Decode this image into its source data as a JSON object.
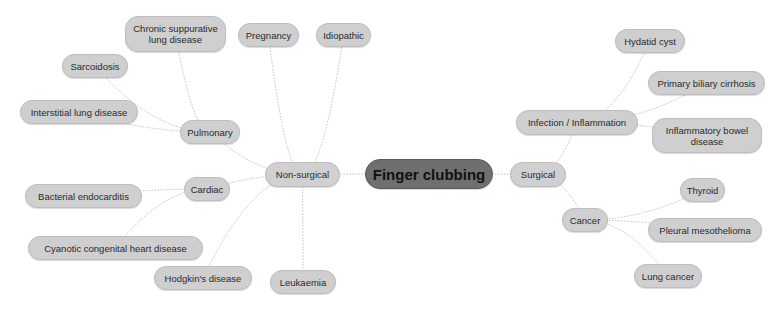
{
  "diagram": {
    "type": "mind-map",
    "colors": {
      "root_fill": "#6f6f6f",
      "node_fill": "#cfcfcf",
      "node_border": "#bdbdbd",
      "link": "#b8b8b8",
      "text": "#2a2a2a"
    },
    "nodes": [
      {
        "id": "root",
        "label": "Finger clubbing",
        "x": 365,
        "y": 159,
        "w": 128,
        "h": 30,
        "cls": "root"
      },
      {
        "id": "nonsurgical",
        "label": "Non-surgical",
        "x": 265,
        "y": 162,
        "w": 75,
        "h": 25,
        "cls": "l1"
      },
      {
        "id": "surgical",
        "label": "Surgical",
        "x": 510,
        "y": 162,
        "w": 56,
        "h": 25,
        "cls": "l1"
      },
      {
        "id": "pulmonary",
        "label": "Pulmonary",
        "x": 180,
        "y": 120,
        "w": 60,
        "h": 24,
        "cls": "l2"
      },
      {
        "id": "cardiac",
        "label": "Cardiac",
        "x": 184,
        "y": 177,
        "w": 46,
        "h": 24,
        "cls": "l2"
      },
      {
        "id": "chronic",
        "label": "Chronic suppurative lung disease",
        "x": 125,
        "y": 16,
        "w": 101,
        "h": 36,
        "cls": "l3"
      },
      {
        "id": "pregnancy",
        "label": "Pregnancy",
        "x": 238,
        "y": 23,
        "w": 61,
        "h": 24,
        "cls": "l3"
      },
      {
        "id": "idiopathic",
        "label": "Idiopathic",
        "x": 316,
        "y": 23,
        "w": 55,
        "h": 24,
        "cls": "l3"
      },
      {
        "id": "sarcoidosis",
        "label": "Sarcoidosis",
        "x": 62,
        "y": 54,
        "w": 66,
        "h": 24,
        "cls": "l3"
      },
      {
        "id": "interstitial",
        "label": "Interstitial lung disease",
        "x": 20,
        "y": 100,
        "w": 118,
        "h": 24,
        "cls": "l3"
      },
      {
        "id": "bacterial",
        "label": "Bacterial endocarditis",
        "x": 25,
        "y": 184,
        "w": 117,
        "h": 24,
        "cls": "l3"
      },
      {
        "id": "cyanotic",
        "label": "Cyanotic congenital heart disease",
        "x": 28,
        "y": 236,
        "w": 175,
        "h": 24,
        "cls": "l3"
      },
      {
        "id": "hodgkin",
        "label": "Hodgkin's disease",
        "x": 154,
        "y": 266,
        "w": 98,
        "h": 24,
        "cls": "l3"
      },
      {
        "id": "leukaemia",
        "label": "Leukaemia",
        "x": 270,
        "y": 270,
        "w": 66,
        "h": 24,
        "cls": "l3"
      },
      {
        "id": "infection",
        "label": "Infection / Inflammation",
        "x": 516,
        "y": 110,
        "w": 122,
        "h": 25,
        "cls": "l2"
      },
      {
        "id": "hydatid",
        "label": "Hydatid cyst",
        "x": 615,
        "y": 29,
        "w": 70,
        "h": 24,
        "cls": "l3"
      },
      {
        "id": "pbc",
        "label": "Primary biliary cirrhosis",
        "x": 648,
        "y": 71,
        "w": 117,
        "h": 24,
        "cls": "l3"
      },
      {
        "id": "ibd",
        "label": "Inflammatory bowel disease",
        "x": 652,
        "y": 118,
        "w": 110,
        "h": 35,
        "cls": "l3"
      },
      {
        "id": "cancer",
        "label": "Cancer",
        "x": 562,
        "y": 208,
        "w": 46,
        "h": 24,
        "cls": "l2"
      },
      {
        "id": "thyroid",
        "label": "Thyroid",
        "x": 680,
        "y": 178,
        "w": 45,
        "h": 24,
        "cls": "l3"
      },
      {
        "id": "pleural",
        "label": "Pleural mesothelioma",
        "x": 648,
        "y": 218,
        "w": 114,
        "h": 24,
        "cls": "l3"
      },
      {
        "id": "lungcancer",
        "label": "Lung cancer",
        "x": 634,
        "y": 264,
        "w": 68,
        "h": 24,
        "cls": "l3"
      }
    ],
    "links": [
      [
        "root",
        "nonsurgical"
      ],
      [
        "root",
        "surgical"
      ],
      [
        "nonsurgical",
        "pulmonary"
      ],
      [
        "nonsurgical",
        "cardiac"
      ],
      [
        "nonsurgical",
        "pregnancy"
      ],
      [
        "nonsurgical",
        "idiopathic"
      ],
      [
        "nonsurgical",
        "hodgkin"
      ],
      [
        "nonsurgical",
        "leukaemia"
      ],
      [
        "pulmonary",
        "chronic"
      ],
      [
        "pulmonary",
        "sarcoidosis"
      ],
      [
        "pulmonary",
        "interstitial"
      ],
      [
        "cardiac",
        "bacterial"
      ],
      [
        "cardiac",
        "cyanotic"
      ],
      [
        "surgical",
        "infection"
      ],
      [
        "surgical",
        "cancer"
      ],
      [
        "infection",
        "hydatid"
      ],
      [
        "infection",
        "pbc"
      ],
      [
        "infection",
        "ibd"
      ],
      [
        "cancer",
        "thyroid"
      ],
      [
        "cancer",
        "pleural"
      ],
      [
        "cancer",
        "lungcancer"
      ]
    ]
  }
}
